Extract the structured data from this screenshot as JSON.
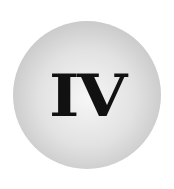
{
  "badge": {
    "label": "IV",
    "colors": {
      "text": "#111111",
      "circle_center": "#f6f6f6",
      "circle_edge": "#b4b4b4",
      "background": "#ffffff"
    }
  }
}
